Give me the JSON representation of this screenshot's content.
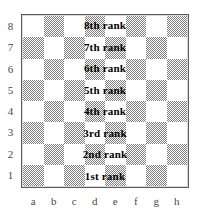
{
  "diagram": {
    "board": {
      "files": [
        "a",
        "b",
        "c",
        "d",
        "e",
        "f",
        "g",
        "h"
      ],
      "ranks": [
        "8",
        "7",
        "6",
        "5",
        "4",
        "3",
        "2",
        "1"
      ],
      "rank_captions": [
        "8th rank",
        "7th rank",
        "6th rank",
        "5th rank",
        "4th rank",
        "3rd rank",
        "2nd rank",
        "1st rank"
      ],
      "top_left_square_color": "light",
      "colors": {
        "light_square": "#ffffff",
        "dark_square": "#808080",
        "border": "#5c5c5c",
        "caption_text": "#000000",
        "coordinate_text": "#4a4a4a",
        "background": "#ffffff"
      }
    }
  }
}
